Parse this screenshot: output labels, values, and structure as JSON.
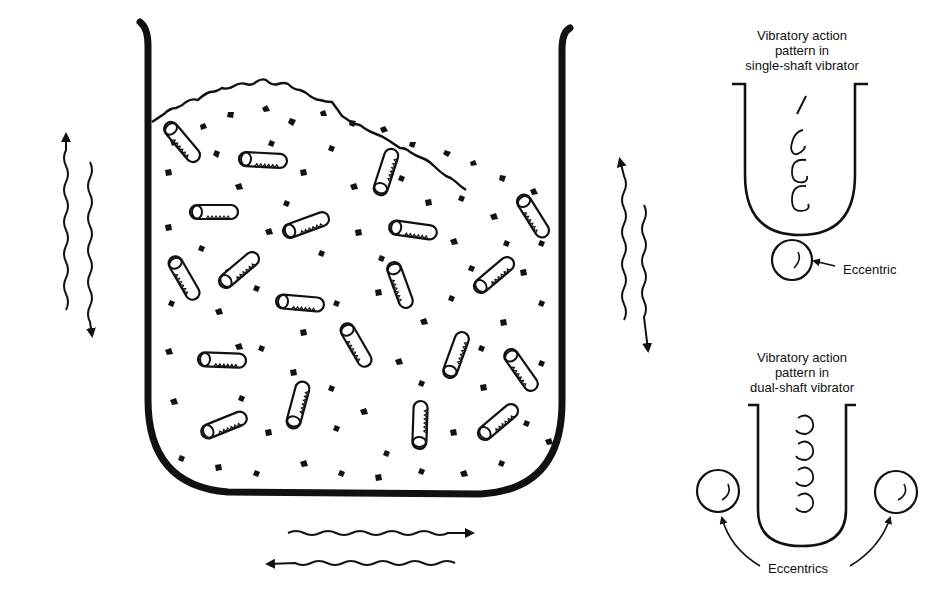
{
  "diagram": {
    "colors": {
      "ink": "#111111",
      "background": "#ffffff"
    },
    "tub": {
      "contents": [
        "abrasive-media-chips",
        "cylindrical-parts"
      ],
      "motion_arrows": [
        "vertical-left",
        "vertical-right",
        "horizontal-bottom"
      ]
    },
    "single_shaft": {
      "caption_line1": "Vibratory action",
      "caption_line2": "pattern in",
      "caption_line3": "single-shaft vibrator",
      "eccentric_label": "Eccentric"
    },
    "dual_shaft": {
      "caption_line1": "Vibratory action",
      "caption_line2": "pattern in",
      "caption_line3": "dual-shaft vibrator",
      "eccentrics_label": "Eccentrics"
    }
  }
}
